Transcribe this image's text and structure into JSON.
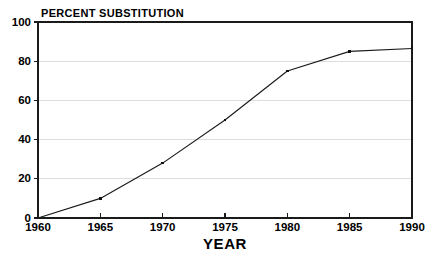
{
  "chart_data": {
    "type": "line",
    "title": "PERCENT SUBSTITUTION",
    "xlabel": "YEAR",
    "ylabel": "",
    "x": [
      1960,
      1965,
      1970,
      1975,
      1980,
      1985,
      1990
    ],
    "values": [
      0,
      10,
      28,
      50,
      75,
      85,
      86.5
    ],
    "series": [
      {
        "name": "Percent substitution",
        "values": [
          0,
          10,
          28,
          50,
          75,
          85,
          86.5
        ]
      }
    ],
    "xlim": [
      1960,
      1990
    ],
    "ylim": [
      0,
      100
    ],
    "x_tick_labels": [
      "1960",
      "1965",
      "1970",
      "1975",
      "1980",
      "1985",
      "1990"
    ],
    "y_tick_labels": [
      "0",
      "20",
      "40",
      "60",
      "80",
      "100"
    ],
    "y_ticks": [
      0,
      20,
      40,
      60,
      80,
      100
    ],
    "grid": "horizontal",
    "grid_color": "#d9d9d9",
    "legend": "none",
    "line_color": "#1a1a1a",
    "marker": "square",
    "background": "#ffffff"
  },
  "labels": {
    "title": "PERCENT SUBSTITUTION",
    "x_axis_title": "YEAR",
    "y_ticks": [
      "0",
      "20",
      "40",
      "60",
      "80",
      "100"
    ],
    "x_ticks": [
      "1960",
      "1965",
      "1970",
      "1975",
      "1980",
      "1985",
      "1990"
    ]
  }
}
